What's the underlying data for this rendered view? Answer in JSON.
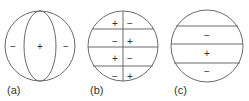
{
  "figure": {
    "panels": [
      {
        "label": "(a)",
        "description": "sphere with central vertical lens region",
        "regions": [
          {
            "name": "left",
            "sign": "−"
          },
          {
            "name": "center",
            "sign": "+"
          },
          {
            "name": "right",
            "sign": "−"
          }
        ]
      },
      {
        "label": "(b)",
        "description": "sphere divided by one vertical and three horizontal lines into 8 regions",
        "regions": [
          {
            "name": "row1-left",
            "sign": "+"
          },
          {
            "name": "row1-right",
            "sign": "−"
          },
          {
            "name": "row2-left",
            "sign": "−"
          },
          {
            "name": "row2-right",
            "sign": "+"
          },
          {
            "name": "row3-left",
            "sign": "+"
          },
          {
            "name": "row3-right",
            "sign": "−"
          },
          {
            "name": "row4-left",
            "sign": "−"
          },
          {
            "name": "row4-right",
            "sign": "+"
          }
        ]
      },
      {
        "label": "(c)",
        "description": "sphere divided by three horizontal lines into 4 zones",
        "regions": [
          {
            "name": "zone1",
            "sign": ""
          },
          {
            "name": "zone2",
            "sign": "−"
          },
          {
            "name": "zone3",
            "sign": "+"
          },
          {
            "name": "zone4",
            "sign": "−"
          }
        ]
      }
    ],
    "colors": {
      "line": "#6a6a6a",
      "text": "#333333",
      "background": "#ffffff"
    }
  }
}
